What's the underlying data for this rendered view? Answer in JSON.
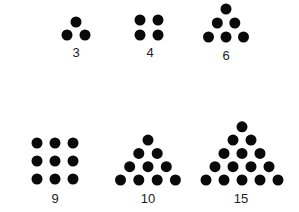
{
  "figures": [
    {
      "id": "fig-3",
      "label": "3",
      "shape": "triangle",
      "rows": [
        1,
        2
      ]
    },
    {
      "id": "fig-4",
      "label": "4",
      "shape": "square",
      "rows": [
        2,
        2
      ]
    },
    {
      "id": "fig-6",
      "label": "6",
      "shape": "triangle",
      "rows": [
        1,
        2,
        3
      ]
    },
    {
      "id": "fig-9",
      "label": "9",
      "shape": "square",
      "rows": [
        3,
        3,
        3
      ]
    },
    {
      "id": "fig-10",
      "label": "10",
      "shape": "triangle",
      "rows": [
        1,
        2,
        3,
        4
      ]
    },
    {
      "id": "fig-15",
      "label": "15",
      "shape": "triangle",
      "rows": [
        1,
        2,
        3,
        4,
        5
      ]
    }
  ]
}
